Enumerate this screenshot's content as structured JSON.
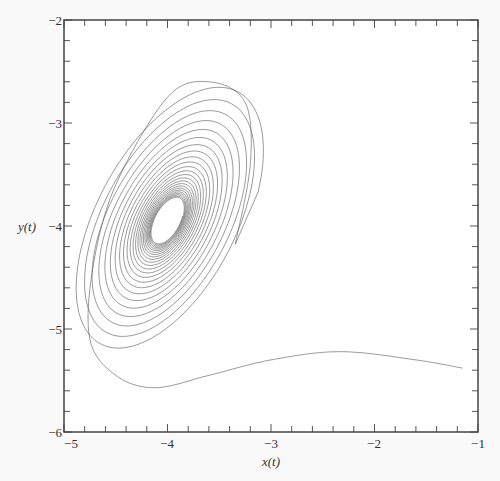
{
  "chart_data": {
    "type": "line",
    "title": "",
    "xlabel": "x(t)",
    "ylabel": "y(t)",
    "xlim": [
      -5,
      -1
    ],
    "ylim": [
      -6,
      -2
    ],
    "x_ticks": [
      -5,
      -4,
      -3,
      -2,
      -1
    ],
    "y_ticks": [
      -2,
      -3,
      -4,
      -5,
      -6
    ],
    "x_tick_labels": [
      "−5",
      "−4",
      "−3",
      "−2",
      "−1"
    ],
    "y_tick_labels": [
      "−2",
      "−3",
      "−4",
      "−5",
      "−6"
    ],
    "minor_tick_step": 0.2,
    "grid": false,
    "legend": "none",
    "series": [
      {
        "name": "trajectory",
        "description": "Damped spiral phase-plane trajectory starting near (-1.15, -5.38) and spiraling inward to a stable focus near (-4.0, -3.95)",
        "start": [
          -1.15,
          -5.38
        ],
        "waypoints": [
          [
            -1.15,
            -5.38
          ],
          [
            -1.6,
            -5.3
          ],
          [
            -2.33,
            -5.22
          ],
          [
            -3.0,
            -5.3
          ],
          [
            -3.6,
            -5.45
          ],
          [
            -4.12,
            -5.57
          ],
          [
            -4.5,
            -5.45
          ],
          [
            -4.75,
            -5.1
          ],
          [
            -4.72,
            -4.4
          ],
          [
            -4.5,
            -3.6
          ],
          [
            -4.0,
            -2.75
          ],
          [
            -3.6,
            -2.6
          ],
          [
            -3.25,
            -2.8
          ],
          [
            -3.2,
            -3.4
          ],
          [
            -3.35,
            -4.2
          ]
        ],
        "equilibrium": [
          -4.0,
          -3.95
        ],
        "color": "#555555"
      }
    ]
  }
}
